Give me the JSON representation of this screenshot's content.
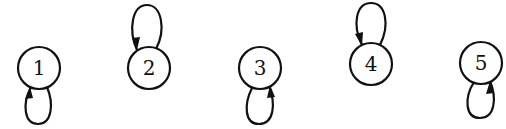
{
  "diagram": {
    "type": "directed-graph",
    "nodes": [
      {
        "id": "1",
        "label": "1",
        "cx": 39,
        "cy": 68,
        "loop": "below",
        "arrow_side": "left"
      },
      {
        "id": "2",
        "label": "2",
        "cx": 149,
        "cy": 68,
        "loop": "above",
        "arrow_side": "left"
      },
      {
        "id": "3",
        "label": "3",
        "cx": 260,
        "cy": 68,
        "loop": "below",
        "arrow_side": "right"
      },
      {
        "id": "4",
        "label": "4",
        "cx": 371,
        "cy": 64,
        "loop": "above",
        "arrow_side": "left"
      },
      {
        "id": "5",
        "label": "5",
        "cx": 481,
        "cy": 63,
        "loop": "below",
        "arrow_side": "right"
      }
    ],
    "edges": [
      {
        "from": "1",
        "to": "1"
      },
      {
        "from": "2",
        "to": "2"
      },
      {
        "from": "3",
        "to": "3"
      },
      {
        "from": "4",
        "to": "4"
      },
      {
        "from": "5",
        "to": "5"
      }
    ],
    "colors": {
      "stroke": "#111111",
      "background": "#ffffff"
    }
  }
}
